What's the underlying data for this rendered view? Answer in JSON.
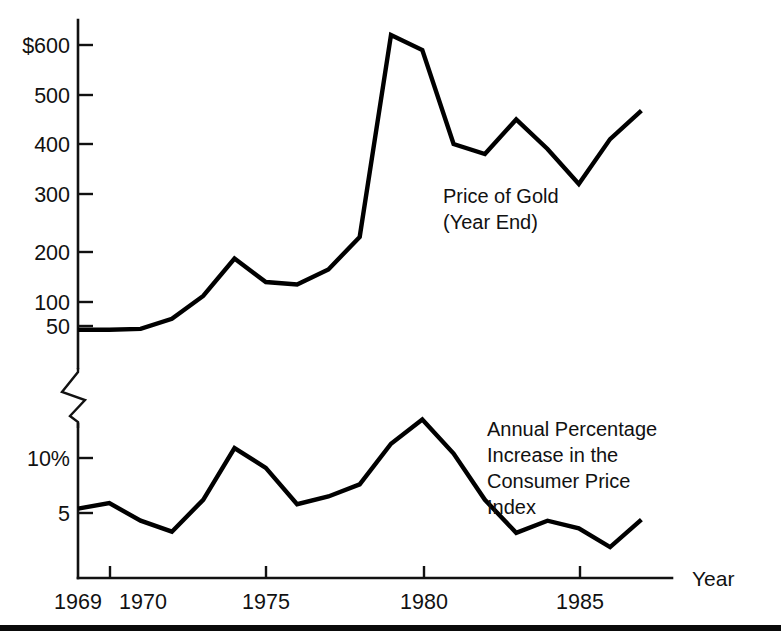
{
  "figure": {
    "bottom_rule": "horizontal-rule"
  },
  "chart_data": {
    "type": "line",
    "title": "",
    "xlabel": "Year",
    "ylabel": "",
    "grid": false,
    "legend_position": "inline-annotation",
    "axis_note": "Two stacked panels sharing one Year axis, separated by an axis break (zigzag).",
    "x": [
      1969,
      1970,
      1971,
      1972,
      1973,
      1974,
      1975,
      1976,
      1977,
      1978,
      1979,
      1980,
      1981,
      1982,
      1983,
      1984,
      1985,
      1986,
      1987
    ],
    "xticks": [
      1969,
      1970,
      1975,
      1980,
      1985
    ],
    "xtick_labels": [
      "1969",
      "1970",
      "1975",
      "1980",
      "1985"
    ],
    "xlim": [
      1969,
      1987.8
    ],
    "panels": [
      {
        "name": "gold",
        "annotation": "Price of Gold\n(Year End)",
        "annotation_lines": [
          "Price of Gold",
          "(Year End)"
        ],
        "yticks": [
          50,
          100,
          200,
          300,
          400,
          500,
          600
        ],
        "ytick_labels": [
          "50",
          "100",
          "200",
          "300",
          "400",
          "500",
          "$600"
        ],
        "ylim": [
          0,
          660
        ],
        "ylabel": "",
        "units": "US dollars per ounce",
        "series": [
          {
            "name": "Price of Gold (Year End)",
            "values": [
              42,
              42,
              44,
              65,
              112,
              187,
              140,
              135,
              165,
              226,
              620,
              590,
              400,
              380,
              450,
              390,
              320,
              410,
              468
            ]
          }
        ]
      },
      {
        "name": "cpi",
        "annotation": "Annual Percentage\nIncrease in the\nConsumer Price\nIndex",
        "annotation_lines": [
          "Annual Percentage",
          "Increase in the",
          "Consumer Price",
          "Index"
        ],
        "yticks": [
          5,
          10
        ],
        "ytick_labels": [
          "5",
          "10%"
        ],
        "ylim": [
          0,
          15.5
        ],
        "ylabel": "",
        "units": "percent",
        "series": [
          {
            "name": "Annual Percentage Increase in the Consumer Price Index",
            "values": [
              5.4,
              5.9,
              4.3,
              3.3,
              6.2,
              10.9,
              9.1,
              5.8,
              6.5,
              7.6,
              11.3,
              13.5,
              10.4,
              6.2,
              3.2,
              4.3,
              3.6,
              1.9,
              4.4
            ]
          }
        ]
      }
    ]
  },
  "labels": {
    "year_axis": "Year",
    "gold_annotation_line1": "Price of Gold",
    "gold_annotation_line2": "(Year End)",
    "cpi_annotation_line1": "Annual Percentage",
    "cpi_annotation_line2": "Increase in the",
    "cpi_annotation_line3": "Consumer Price",
    "cpi_annotation_line4": "Index",
    "ytick_600": "$600",
    "ytick_500": "500",
    "ytick_400": "400",
    "ytick_300": "300",
    "ytick_200": "200",
    "ytick_100": "100",
    "ytick_50": "50",
    "ytick_10pct": "10%",
    "ytick_5": "5",
    "xtick_1969": "1969",
    "xtick_1970": "1970",
    "xtick_1975": "1975",
    "xtick_1980": "1980",
    "xtick_1985": "1985"
  },
  "colors": {
    "ink": "#111111",
    "line": "#000000",
    "background": "#ffffff"
  }
}
